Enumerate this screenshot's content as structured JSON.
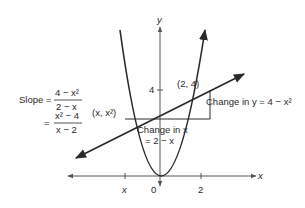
{
  "figure": {
    "axes": {
      "x_label": "x",
      "y_label": "y",
      "x_ticks": [
        {
          "label": "x",
          "pos": "x"
        },
        {
          "label": "0",
          "pos": 0
        },
        {
          "label": "2",
          "pos": 2
        }
      ],
      "y_ticks": [
        {
          "label": "4",
          "pos": 4
        }
      ]
    },
    "curve": {
      "equation": "y = x^2"
    },
    "points": {
      "left": "(x, x²)",
      "right": "(2, 4)"
    },
    "slope": {
      "label": "Slope =",
      "num1": "4 − x²",
      "den1": "2 − x",
      "eq": "=",
      "num2": "x² − 4",
      "den2": "x − 2"
    },
    "change_y": "Change in y = 4 − x²",
    "change_x_line1": "Change in x",
    "change_x_line2": "= 2 − x",
    "colors": {
      "ink": "#2a2a2a",
      "axis": "#555555"
    }
  }
}
